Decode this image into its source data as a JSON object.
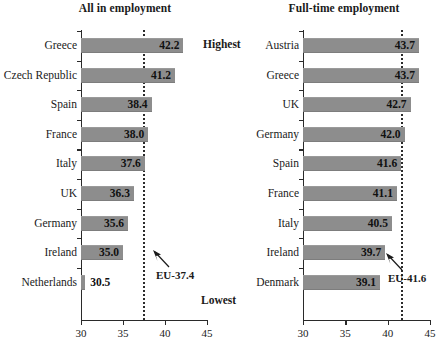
{
  "chart_data": [
    {
      "type": "bar",
      "orientation": "horizontal",
      "title": "All in employment",
      "xlabel": "",
      "ylabel": "",
      "xlim": [
        30,
        45
      ],
      "xticks": [
        30,
        35,
        40,
        45
      ],
      "xtick_labels": [
        "30",
        "35",
        "40",
        "45"
      ],
      "grid": false,
      "legend": "none",
      "categories": [
        "Greece",
        "Czech Republic",
        "Spain",
        "France",
        "Italy",
        "UK",
        "Germany",
        "Ireland",
        "Netherlands"
      ],
      "values": [
        42.2,
        41.2,
        38.4,
        38.0,
        37.6,
        36.3,
        35.6,
        35.0,
        30.5
      ],
      "value_labels": [
        "42.2",
        "41.2",
        "38.4",
        "38.0",
        "37.6",
        "36.3",
        "35.6",
        "35.0",
        "30.5"
      ],
      "reference_line": {
        "value": 41.6,
        "position_value": 37.4,
        "label": "EU-37.4"
      },
      "annotations": {
        "top": "Highest",
        "bottom": "Lowest"
      }
    },
    {
      "type": "bar",
      "orientation": "horizontal",
      "title": "Full-time employment",
      "xlabel": "",
      "ylabel": "",
      "xlim": [
        30,
        45
      ],
      "xticks": [
        30,
        35,
        40,
        45
      ],
      "xtick_labels": [
        "30",
        "35",
        "40",
        "45"
      ],
      "grid": false,
      "legend": "none",
      "categories": [
        "Austria",
        "Greece",
        "UK",
        "Germany",
        "Spain",
        "France",
        "Italy",
        "Ireland",
        "Denmark"
      ],
      "values": [
        43.7,
        43.7,
        42.7,
        42.0,
        41.6,
        41.1,
        40.5,
        39.7,
        39.1
      ],
      "value_labels": [
        "43.7",
        "43.7",
        "42.7",
        "42.0",
        "41.6",
        "41.1",
        "40.5",
        "39.7",
        "39.1"
      ],
      "reference_line": {
        "value": 41.6,
        "position_value": 41.6,
        "label": "EU-41.6"
      },
      "annotations": {
        "top": "",
        "bottom": ""
      }
    }
  ],
  "colors": {
    "bar_fill": "#8d8d8d",
    "axis": "#2a2a2a",
    "reference_line": "#2b2b2b",
    "text": "#1a1a1a",
    "background": "#ffffff"
  }
}
